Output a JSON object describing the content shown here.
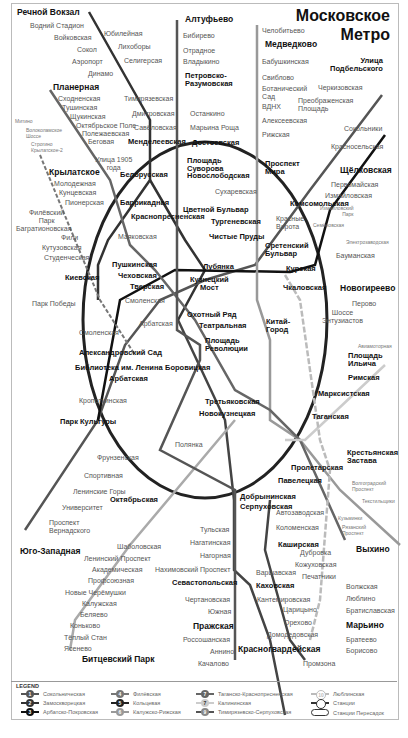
{
  "title": {
    "line1": "Московское",
    "line2": "Метро"
  },
  "colors": {
    "line1": "#555555",
    "line2": "#333333",
    "line3": "#111111",
    "line4": "#444444",
    "line5": "#888888",
    "line6": "#aaaaaa",
    "line7": "#cccccc",
    "line8": "#666666",
    "line9": "#777777",
    "line10": "#bbbbbb"
  },
  "stations": {
    "rechnoy": "Речной Вокзал",
    "vodny": "Водний Стадион",
    "voykovskaya": "Войковская",
    "sokol": "Сокол",
    "aeroport": "Аэропорт",
    "dinamo": "Динамо",
    "yubileynaya": "Юбилейная",
    "likhobory": "Лихоборы",
    "seligerskaya": "Селигерсая",
    "altufyevo": "Алтуфьево",
    "bibirevo": "Бибирево",
    "otradnoe": "Отрадное",
    "vladykino": "Владыкино",
    "petrovsko1": "Петровско-",
    "petrovsko2": "Разумовская",
    "timiryazevskaya": "Тимирязевская",
    "dmitrovskaya": "Дмитровская",
    "savyolovskaya": "Савёловская",
    "mendeleevskaya": "Менделеевская",
    "ostankino": "Останкино",
    "maryina": "Марьина Роща",
    "dostoevskaya": "Достоевская",
    "chelobitevo": "Челобитьево",
    "medvedkovo": "Медведково",
    "babushkinskaya": "Бабушкинская",
    "sviblovo": "Свиблово",
    "botanich1": "Ботанический",
    "botanich2": "Сад",
    "vdnh": "ВДНХ",
    "alekseevskaya": "Алексеевская",
    "rizhskaya": "Рижская",
    "podbelsk1": "Улица",
    "podbelsk2": "Подбельского",
    "cherkizovskaya": "Черкизовская",
    "preobr1": "Преображенская",
    "preobr2": "Площадь",
    "sokolniki": "Сокольники",
    "krasnoselskaya": "Красносельская",
    "planernaya": "Планерная",
    "skhodnenskaya": "Сходненская",
    "tushinskaya": "Тушинская",
    "shchukinskaya": "Щукинская",
    "oktyabrskoe": "Октябрьское Поле",
    "polezhaevskaya": "Полежаевская",
    "begovaya": "Беговая",
    "ulitsa1905a": "Улица 1905",
    "ulitsa1905b": "года",
    "mitino": "Митино",
    "volokol1": "Волоколамское",
    "volokol2": "Шоссе",
    "strogino": "Строгино",
    "krylatskoe2": "Крылатское-2",
    "krylatskoe": "Крылатское",
    "molodezhnaya": "Молодежная",
    "kuntsevskaya": "Кунцевская",
    "pionerskaya": "Пионерская",
    "filevsky1": "Филёвский",
    "filevsky2": "Парк",
    "bagrationovskaya": "Багратионовская",
    "fili": "Фили",
    "kutuzovskaya": "Кутузовская",
    "studencheskaya": "Студенческая",
    "belorusskaya": "Белорусская",
    "novoslobodskaya": "Новослободская",
    "suvorova1": "Площадь",
    "suvorova2": "Суворова",
    "prospekt_mira1": "Проспект",
    "prospekt_mira2": "Мира",
    "sukharevskaya": "Сухаревская",
    "tsvetnoy": "Цветной Бульвар",
    "turgenevskaya": "Тургеневская",
    "chistye": "Чистые Пруды",
    "sretensky1": "Сретенский",
    "sretensky2": "Бульвар",
    "komsomolskaya": "Комсомольская",
    "krasnye1": "Красные",
    "krasnye2": "Ворота",
    "shchelkovskaya": "Щёлковская",
    "pervomayskaya": "Первомайская",
    "izmaylovskaya": "Измайловская",
    "izm_park1": "Измайловский",
    "izm_park2": "Парк",
    "semenovskaya": "Семёновская",
    "elektrozavodskaya": "Электрозаводская",
    "baumanskaya": "Бауманская",
    "barrikadnaya": "Баррикадная",
    "krasnopresnenskaya": "Краснопресненская",
    "mayakovskaya": "Маяковская",
    "pushkinskaya": "Пушкинская",
    "chekhovskaya": "Чеховская",
    "tverskaya": "Тверская",
    "lubyanka": "Лубянка",
    "kuznetsky1": "Кузнецкий",
    "kuznetsky2": "Мост",
    "kurskaya": "Курская",
    "chkalovskaya": "Чкаловская",
    "kievskaya": "Киевская",
    "park_pobedy": "Парк Победы",
    "smolenskaya_a": "Смоленская",
    "arbatskaya_a": "Арбатская",
    "smolenskaya_b": "Смоленская",
    "okhotny": "Охотный Ряд",
    "teatralnaya": "Театральная",
    "revolyutsii1": "Площадь",
    "revolyutsii2": "Революции",
    "kitay1": "Китай-",
    "kitay2": "Город",
    "aleksandrovsky": "Александровский Сад",
    "biblioteka": "Библиотека им. Ленина",
    "arbatskaya_b": "Арбатская",
    "borovitskaya": "Боровицкая",
    "kropotkinskaya": "Кропоткинская",
    "novogireevo": "Новогиреево",
    "perovo": "Перово",
    "entuziastov1": "Шоссе",
    "entuziastov2": "Энтузиастов",
    "aviamotornaya": "Авиамоторная",
    "ilyicha1": "Площадь",
    "ilyicha2": "Ильича",
    "rimskaya": "Римская",
    "marksistskaya": "Марксистская",
    "park_kultury": "Парк Культуры",
    "frunzenskaya": "Фрунзенская",
    "sportivnaya": "Спортивная",
    "leninskie": "Ленинские Горы",
    "universitet": "Университет",
    "vernadsk1": "Проспект",
    "vernadsk2": "Вернадского",
    "yugo_zapadnaya": "Юго-Западная",
    "tretyakovskaya": "Третьяковская",
    "novokuznetskaya": "Новокузнецкая",
    "polyanka": "Полянка",
    "taganskaya": "Таганская",
    "oktyabrskaya": "Октябрьская",
    "dobryninskaya": "Добрынинская",
    "serpukhovskaya": "Серпуховская",
    "paveletskaya": "Павелецкая",
    "proletarskaya": "Пролетарская",
    "krest1": "Крестьянская",
    "krest2": "Застава",
    "volgograd1": "Волгоградский",
    "volgograd2": "Проспект",
    "tekstilshchiki": "Текстильщики",
    "kuzminki": "Кузьминки",
    "ryazansky1": "Рязанский",
    "ryazansky2": "Проспект",
    "vykhino": "Выхино",
    "avtozavodskaya": "Автозаводская",
    "kolomenskaya": "Коломенская",
    "kashirskaya": "Каширская",
    "varshavskaya": "Варшавская",
    "kakhovskaya": "Каховская",
    "tulskaya": "Тульская",
    "nagatinskaya": "Нагатинская",
    "nagornaya": "Нагорная",
    "nakhimovsky": "Нахимовский Проспект",
    "sevastopolskaya": "Севастопольская",
    "chertanovskaya": "Чертановская",
    "yuzhnaya": "Южная",
    "prazhskaya": "Пражская",
    "rossoshanskaya": "Россошанская",
    "annino": "Аннино",
    "kachalovo": "Качалово",
    "shabolovskaya": "Шаболовская",
    "leninsky": "Ленинский Проспект",
    "akademicheskaya": "Академическая",
    "profsoyuznaya": "Профсоюзная",
    "cheryomushki": "Новые Черёмушки",
    "kaluzhskaya": "Калужская",
    "belyaevo": "Беляево",
    "konkovo": "Коньково",
    "tyoply": "Тёплый Стан",
    "yasenevo": "Ясенево",
    "bitsevsky": "Битцевский Парк",
    "dubrovka": "Дубровка",
    "kozhukhovskaya": "Кожуховская",
    "pechatniki": "Печатники",
    "volzhskaya": "Волжская",
    "lyublino": "Люблино",
    "bratislavskaya": "Братиславская",
    "maryino": "Марьино",
    "bratevo": "Братеево",
    "borisovo": "Борисово",
    "kantemirovskaya": "Кантемировская",
    "tsaritsyno": "Царицыно",
    "orekhovo": "Орехово",
    "domodedovskaya": "Домодедовская",
    "krasnogvardeyskaya": "Красногвардейская",
    "promzona": "Промзона"
  },
  "legend": {
    "header": "LEGEND",
    "items": [
      {
        "num": "1",
        "label": "Сокольническая"
      },
      {
        "num": "2",
        "label": "Замоскворецкая"
      },
      {
        "num": "3",
        "label": "Арбатско-Покровская"
      },
      {
        "num": "4",
        "label": "Филёвская"
      },
      {
        "num": "5",
        "label": "Кольцевая"
      },
      {
        "num": "6",
        "label": "Калужско-Рижская"
      },
      {
        "num": "7",
        "label": "Таганско-Краснопресненская"
      },
      {
        "num": "7",
        "label": "Калининская"
      },
      {
        "num": "9",
        "label": "Тимирязевско-Серпуховская"
      },
      {
        "num": "10",
        "label": "Люблинская"
      },
      {
        "num": "",
        "label": "Станции"
      },
      {
        "num": "",
        "label": "Станции Пересадок"
      }
    ]
  }
}
